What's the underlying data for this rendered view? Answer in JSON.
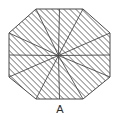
{
  "figure": {
    "caption": "A",
    "shape_name": "octagon",
    "fill_pattern": "diagonal-hatch",
    "partition": "pinwheel-8-sectors",
    "stroke_color": "#4a4a4a",
    "hatch_color": "#6e6e6e",
    "background_color": "#ffffff",
    "hatch_spacing_px": 3,
    "hatch_angle_deg": 45,
    "stroke_width_px": 0.9,
    "center": {
      "x": 58.5,
      "y": 55.5
    },
    "outline_vertices": [
      {
        "x": 36.0,
        "y": 9.0
      },
      {
        "x": 83.0,
        "y": 9.0
      },
      {
        "x": 110.0,
        "y": 33.0
      },
      {
        "x": 110.0,
        "y": 77.0
      },
      {
        "x": 83.0,
        "y": 99.0
      },
      {
        "x": 36.0,
        "y": 99.0
      },
      {
        "x": 9.0,
        "y": 77.0
      },
      {
        "x": 9.0,
        "y": 33.0
      }
    ],
    "spoke_endpoints": [
      {
        "x": 36.0,
        "y": 9.0
      },
      {
        "x": 83.0,
        "y": 9.0
      },
      {
        "x": 110.0,
        "y": 33.0
      },
      {
        "x": 110.0,
        "y": 77.0
      },
      {
        "x": 83.0,
        "y": 99.0
      },
      {
        "x": 36.0,
        "y": 99.0
      },
      {
        "x": 9.0,
        "y": 77.0
      },
      {
        "x": 9.0,
        "y": 33.0
      }
    ],
    "inner_pinwheel_endpoints": [
      {
        "x": 59.5,
        "y": 9.0
      },
      {
        "x": 110.0,
        "y": 55.0
      },
      {
        "x": 59.5,
        "y": 99.0
      },
      {
        "x": 9.0,
        "y": 55.0
      }
    ],
    "sector_count": 8
  }
}
